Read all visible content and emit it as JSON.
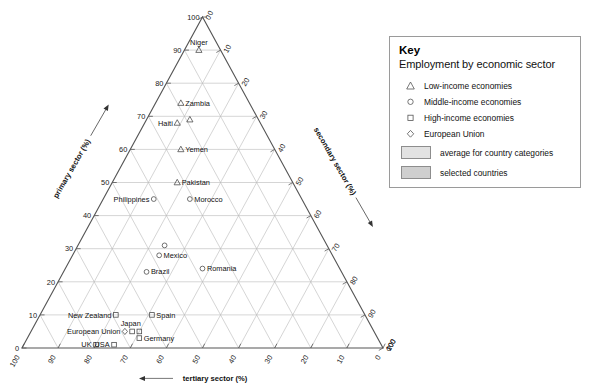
{
  "legend": {
    "title": "Key",
    "subtitle": "Employment by economic sector",
    "entries": [
      {
        "symbol": "triangle",
        "label": "Low-income economies"
      },
      {
        "symbol": "circle",
        "label": "Middle-income economies"
      },
      {
        "symbol": "square",
        "label": "High-income economies"
      },
      {
        "symbol": "diamond",
        "label": "European Union"
      }
    ],
    "swatches": [
      {
        "label": "average for country categories",
        "color": "#e2e2e2"
      },
      {
        "label": "selected countries",
        "color": "#cfcfcf"
      }
    ]
  },
  "chart_data": {
    "type": "scatter",
    "plot_kind": "ternary",
    "title": "",
    "axes": {
      "left": {
        "label": "primary sector (%)",
        "ticks": [
          0,
          10,
          20,
          30,
          40,
          50,
          60,
          70,
          80,
          90,
          100
        ],
        "direction": "up"
      },
      "right": {
        "label": "secondary sector (%)",
        "ticks": [
          0,
          10,
          20,
          30,
          40,
          50,
          60,
          70,
          80,
          90,
          100
        ],
        "direction": "down-right"
      },
      "bottom": {
        "label": "tertiary sector (%)",
        "ticks": [
          100,
          90,
          80,
          70,
          60,
          50,
          40,
          30,
          20,
          10,
          0
        ],
        "direction": "left"
      }
    },
    "grid": true,
    "legend_position": "right",
    "points": [
      {
        "name": "Niger",
        "primary": 90,
        "secondary": 4,
        "tertiary": 6,
        "group": "low-income",
        "symbol": "triangle",
        "label_pos": "above"
      },
      {
        "name": "Zambia",
        "primary": 74,
        "secondary": 7,
        "tertiary": 19,
        "group": "low-income",
        "symbol": "triangle",
        "label_pos": "right"
      },
      {
        "name": "Haiti",
        "primary": 68,
        "secondary": 9,
        "tertiary": 23,
        "group": "low-income",
        "symbol": "triangle",
        "label_pos": "left"
      },
      {
        "name": "",
        "primary": 69,
        "secondary": 12,
        "tertiary": 19,
        "group": "low-income-avg",
        "symbol": "triangle",
        "label_pos": "none"
      },
      {
        "name": "Yemen",
        "primary": 60,
        "secondary": 14,
        "tertiary": 26,
        "group": "low-income",
        "symbol": "triangle",
        "label_pos": "right"
      },
      {
        "name": "Pakistan",
        "primary": 50,
        "secondary": 18,
        "tertiary": 32,
        "group": "low-income",
        "symbol": "triangle",
        "label_pos": "right"
      },
      {
        "name": "Philippines",
        "primary": 45,
        "secondary": 14,
        "tertiary": 41,
        "group": "middle-income",
        "symbol": "circle",
        "label_pos": "left"
      },
      {
        "name": "Morocco",
        "primary": 45,
        "secondary": 24,
        "tertiary": 31,
        "group": "middle-income",
        "symbol": "circle",
        "label_pos": "right"
      },
      {
        "name": "",
        "primary": 31,
        "secondary": 24,
        "tertiary": 45,
        "group": "middle-avg",
        "symbol": "circle",
        "label_pos": "none"
      },
      {
        "name": "Mexico",
        "primary": 28,
        "secondary": 24,
        "tertiary": 48,
        "group": "middle-income",
        "symbol": "circle",
        "label_pos": "right"
      },
      {
        "name": "Brazil",
        "primary": 23,
        "secondary": 23,
        "tertiary": 54,
        "group": "middle-income",
        "symbol": "circle",
        "label_pos": "right"
      },
      {
        "name": "Romania",
        "primary": 24,
        "secondary": 38,
        "tertiary": 38,
        "group": "middle-income",
        "symbol": "circle",
        "label_pos": "right"
      },
      {
        "name": "New Zealand",
        "primary": 10,
        "secondary": 21,
        "tertiary": 69,
        "group": "high-income",
        "symbol": "square",
        "label_pos": "left"
      },
      {
        "name": "Spain",
        "primary": 10,
        "secondary": 31,
        "tertiary": 59,
        "group": "high-income",
        "symbol": "square",
        "label_pos": "right"
      },
      {
        "name": "Japan",
        "primary": 5,
        "secondary": 30,
        "tertiary": 65,
        "group": "high-income",
        "symbol": "square",
        "label_pos": "above-left"
      },
      {
        "name": "Germany",
        "primary": 3,
        "secondary": 31,
        "tertiary": 66,
        "group": "high-income",
        "symbol": "square",
        "label_pos": "right"
      },
      {
        "name": "European Union",
        "primary": 5,
        "secondary": 26,
        "tertiary": 69,
        "group": "european-union",
        "symbol": "diamond",
        "label_pos": "left"
      },
      {
        "name": "",
        "primary": 5,
        "secondary": 28,
        "tertiary": 67,
        "group": "high-income-avg",
        "symbol": "square",
        "label_pos": "none"
      },
      {
        "name": "UK",
        "primary": 1,
        "secondary": 20,
        "tertiary": 79,
        "group": "high-income",
        "symbol": "square",
        "label_pos": "left"
      },
      {
        "name": "USA",
        "primary": 1,
        "secondary": 25,
        "tertiary": 74,
        "group": "high-income",
        "symbol": "square",
        "label_pos": "left"
      }
    ]
  }
}
